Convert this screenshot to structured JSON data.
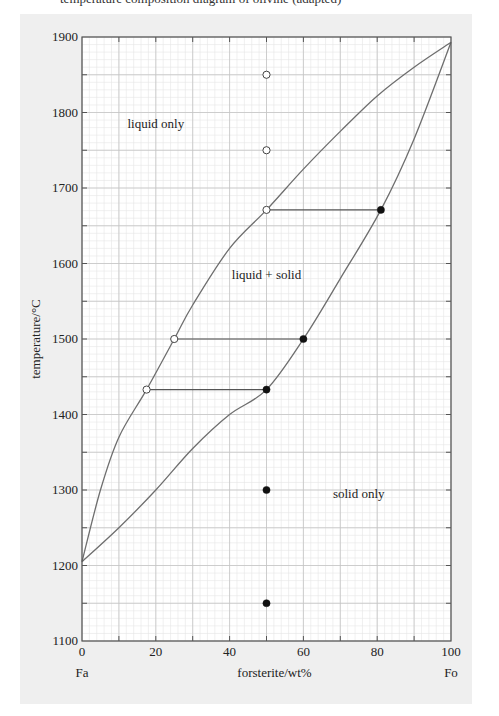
{
  "header_fragment": "temperature  composition  diagram of olivine  (adapted)",
  "chart_data": {
    "type": "line",
    "title": "",
    "xlabel": "forsterite/wt%",
    "ylabel": "temperature/°C",
    "xlim": [
      0,
      100
    ],
    "ylim": [
      1100,
      1900
    ],
    "xticks": [
      0,
      20,
      40,
      60,
      80,
      100
    ],
    "yticks": [
      1100,
      1200,
      1300,
      1400,
      1500,
      1600,
      1700,
      1800,
      1900
    ],
    "x_end_labels": {
      "left": "Fa",
      "right": "Fo"
    },
    "grid": {
      "major_x": 10,
      "major_y": 50,
      "minor_x": 2,
      "minor_y": 10
    },
    "series": [
      {
        "name": "liquidus",
        "points": [
          [
            0,
            1205
          ],
          [
            5,
            1300
          ],
          [
            10,
            1370
          ],
          [
            17.5,
            1433
          ],
          [
            25,
            1500
          ],
          [
            30,
            1545
          ],
          [
            40,
            1620
          ],
          [
            50,
            1671
          ],
          [
            60,
            1725
          ],
          [
            70,
            1775
          ],
          [
            80,
            1822
          ],
          [
            90,
            1860
          ],
          [
            100,
            1893
          ]
        ]
      },
      {
        "name": "solidus",
        "points": [
          [
            0,
            1205
          ],
          [
            10,
            1250
          ],
          [
            20,
            1300
          ],
          [
            30,
            1355
          ],
          [
            40,
            1400
          ],
          [
            50,
            1433
          ],
          [
            60,
            1500
          ],
          [
            70,
            1580
          ],
          [
            81,
            1671
          ],
          [
            90,
            1765
          ],
          [
            100,
            1893
          ]
        ]
      }
    ],
    "tie_lines": [
      {
        "T": 1671,
        "liquid_x": 50,
        "solid_x": 81
      },
      {
        "T": 1500,
        "liquid_x": 25,
        "solid_x": 60
      },
      {
        "T": 1433,
        "liquid_x": 17.5,
        "solid_x": 50
      }
    ],
    "open_points": [
      [
        50,
        1850
      ],
      [
        50,
        1750
      ],
      [
        50,
        1671
      ],
      [
        25,
        1500
      ],
      [
        17.5,
        1433
      ]
    ],
    "filled_points": [
      [
        81,
        1671
      ],
      [
        60,
        1500
      ],
      [
        50,
        1433
      ],
      [
        50,
        1300
      ],
      [
        50,
        1150
      ]
    ],
    "annotations": [
      {
        "text": "liquid only",
        "x": 20,
        "y": 1780
      },
      {
        "text": "liquid + solid",
        "x": 50,
        "y": 1580
      },
      {
        "text": "solid only",
        "x": 75,
        "y": 1290
      }
    ]
  }
}
